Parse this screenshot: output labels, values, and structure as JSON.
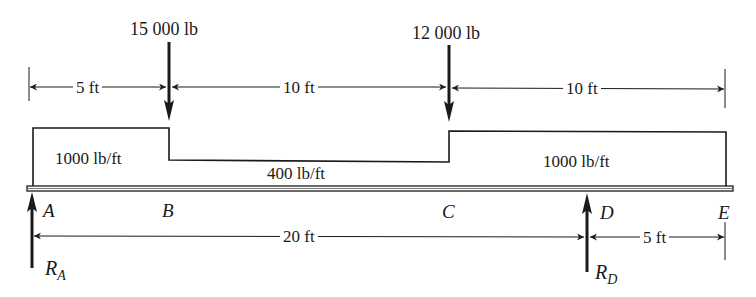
{
  "figure": {
    "type": "beam loading diagram",
    "beam": {
      "start_point": "A",
      "end_point": "E",
      "total_length_ft": 25
    }
  },
  "points": [
    {
      "id": "A",
      "label": "A",
      "position_ft": 0
    },
    {
      "id": "B",
      "label": "B",
      "position_ft": 5
    },
    {
      "id": "C",
      "label": "C",
      "position_ft": 15
    },
    {
      "id": "D",
      "label": "D",
      "position_ft": 20
    },
    {
      "id": "E",
      "label": "E",
      "position_ft": 25
    }
  ],
  "point_loads": [
    {
      "at": "B",
      "label": "15 000 lb",
      "value_lb": 15000,
      "direction": "down"
    },
    {
      "at": "C",
      "label": "12 000 lb",
      "value_lb": 12000,
      "direction": "down"
    }
  ],
  "distributed_loads": [
    {
      "from": "A",
      "to": "B",
      "label": "1000 lb/ft",
      "value_lb_per_ft": 1000
    },
    {
      "from": "B",
      "to": "C",
      "label": "400 lb/ft",
      "value_lb_per_ft": 400
    },
    {
      "from": "C",
      "to": "E",
      "label": "1000 lb/ft",
      "value_lb_per_ft": 1000
    }
  ],
  "reactions": [
    {
      "at": "A",
      "symbol": "R",
      "subscript": "A",
      "direction": "up"
    },
    {
      "at": "D",
      "symbol": "R",
      "subscript": "D",
      "direction": "up"
    }
  ],
  "dimensions": {
    "upper": [
      {
        "from": "A",
        "to": "B",
        "label": "5 ft"
      },
      {
        "from": "B",
        "to": "C",
        "label": "10 ft"
      },
      {
        "from": "C",
        "to": "E",
        "label": "10 ft"
      }
    ],
    "lower": [
      {
        "from": "A",
        "to": "D",
        "label": "20 ft"
      },
      {
        "from": "D",
        "to": "E",
        "label": "5 ft"
      }
    ]
  },
  "colors": {
    "ink": "#1a1a1a",
    "background": "#ffffff"
  }
}
